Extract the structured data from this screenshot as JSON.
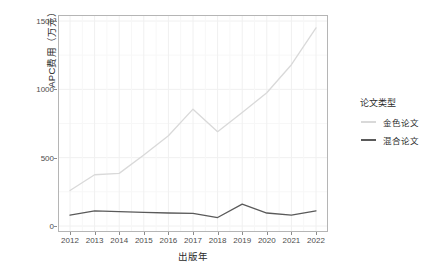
{
  "chart_data": {
    "type": "line",
    "title": "",
    "xlabel": "出版年",
    "ylabel": "APC费用（万元）",
    "x": [
      2012,
      2013,
      2014,
      2015,
      2016,
      2017,
      2018,
      2019,
      2020,
      2021,
      2022
    ],
    "categories": [
      "2012",
      "2013",
      "2014",
      "2015",
      "2016",
      "2017",
      "2018",
      "2019",
      "2020",
      "2021",
      "2022"
    ],
    "xlim": [
      2012,
      2022
    ],
    "ylim": [
      0,
      1500
    ],
    "yticks": [
      0,
      500,
      1000,
      1500
    ],
    "ytick_labels": [
      "0",
      "500",
      "1000",
      "1500"
    ],
    "grid": true,
    "legend_position": "right",
    "legend_title": "论文类型",
    "series": [
      {
        "name": "金色论文",
        "color": "#d9d9d9",
        "values": [
          260,
          375,
          385,
          520,
          660,
          855,
          690,
          830,
          975,
          1180,
          1450
        ]
      },
      {
        "name": "混合论文",
        "color": "#5a5a5a",
        "values": [
          80,
          110,
          105,
          100,
          95,
          92,
          62,
          160,
          95,
          80,
          110
        ]
      }
    ]
  },
  "axis": {
    "y_title": "APC费用（万元）",
    "x_title": "出版年"
  },
  "legend": {
    "title": "论文类型",
    "items": [
      {
        "label": "金色论文",
        "color": "#d9d9d9"
      },
      {
        "label": "混合论文",
        "color": "#5a5a5a"
      }
    ]
  },
  "colors": {
    "panel_background": "#ffffff",
    "panel_border": "#b5b5b5",
    "grid_major": "#f0f0f0",
    "grid_minor": "#f7f7f7",
    "tick_text": "#4d4d4d",
    "title_text": "#2b2b2b"
  }
}
